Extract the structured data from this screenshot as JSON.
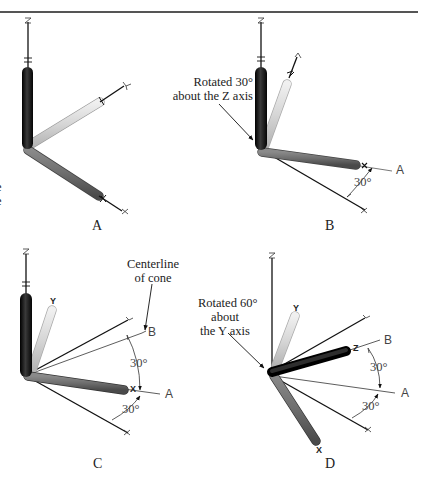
{
  "figure": {
    "panels": [
      {
        "id": "A",
        "label": "A",
        "description": "Initial axis orientation",
        "axis_tags": {
          "z": "Z",
          "y": "Y",
          "x": "X"
        }
      },
      {
        "id": "B",
        "label": "B",
        "callout": {
          "line1": "Rotated 30°",
          "line2": "about the Z axis"
        },
        "angle_label": "30°",
        "ref_tag": "A",
        "axis_tags": {
          "z": "Z",
          "y": "Y",
          "x": "X"
        }
      },
      {
        "id": "C",
        "label": "C",
        "callout": {
          "line1": "Centerline",
          "line2": "of cone"
        },
        "angle_upper": "30°",
        "angle_lower": "30°",
        "ref_tag_b": "B",
        "ref_tag_a": "A",
        "axis_tags": {
          "z": "Z",
          "y": "Y",
          "x": "X"
        }
      },
      {
        "id": "D",
        "label": "D",
        "callout": {
          "line1": "Rotated 60°",
          "line2": "about",
          "line3": "the Y axis"
        },
        "angle_upper": "30°",
        "angle_lower": "30°",
        "ref_tag_b": "B",
        "ref_tag_a": "A",
        "axis_tags": {
          "z": "Z",
          "y": "Y",
          "x": "X"
        }
      }
    ],
    "edge_fragments": [
      "e",
      "e"
    ],
    "colors": {
      "z_tube": "#1a1a1a",
      "y_tube": "#d8d8d8",
      "x_tube": "#6e6e6e",
      "line": "#111111",
      "thin_line": "#333333",
      "rule": "#555555"
    }
  }
}
